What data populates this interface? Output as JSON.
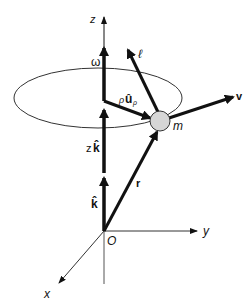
{
  "diagram": {
    "colors": {
      "stroke": "#111111",
      "thin_line": "#333333",
      "mass_fill": "#d6d6d6"
    },
    "axes": {
      "z_label": "z",
      "y_label": "y",
      "x_label": "x",
      "origin_label": "O"
    },
    "vectors": {
      "omega": "ω",
      "ell": "ℓ",
      "rho_u_prefix": "ρ",
      "rho_u_main": "û",
      "rho_u_sub": "ρ",
      "v": "v",
      "r": "r",
      "z_k_prefix": "z",
      "z_k_main": "k̂",
      "k_hat": "k̂"
    },
    "mass_label": "m"
  }
}
